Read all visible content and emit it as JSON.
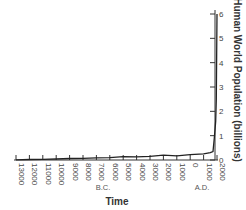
{
  "chart_data": {
    "type": "line",
    "title": "",
    "xlabel": "Time",
    "ylabel": "Human World Population (billions)",
    "x_tick_labels": [
      "13000",
      "12000",
      "11000",
      "10000",
      "9000",
      "8000",
      "7000",
      "6000",
      "5000",
      "4000",
      "3000",
      "2000",
      "1000",
      "0",
      "1000",
      "2000"
    ],
    "x_era_labels": {
      "bc": "B.C.",
      "ad": "A.D."
    },
    "y_tick_labels": [
      "0",
      "1",
      "2",
      "3",
      "4",
      "5",
      "6"
    ],
    "ylim": [
      0,
      6
    ],
    "xlim": [
      -13000,
      2000
    ],
    "grid": false,
    "legend": null,
    "series": [
      {
        "name": "Human World Population",
        "x": [
          -13000,
          -12000,
          -11000,
          -10000,
          -9000,
          -8000,
          -7000,
          -6000,
          -5000,
          -4000,
          -3000,
          -2000,
          -1000,
          0,
          1000,
          1500,
          1700,
          1800,
          1900,
          1950,
          2000
        ],
        "values": [
          0.01,
          0.02,
          0.03,
          0.04,
          0.06,
          0.07,
          0.09,
          0.1,
          0.14,
          0.13,
          0.15,
          0.2,
          0.17,
          0.22,
          0.25,
          0.3,
          0.35,
          0.9,
          1.6,
          2.5,
          6.0
        ]
      }
    ],
    "colors": {
      "line": "#222222",
      "axis": "#333333"
    }
  }
}
